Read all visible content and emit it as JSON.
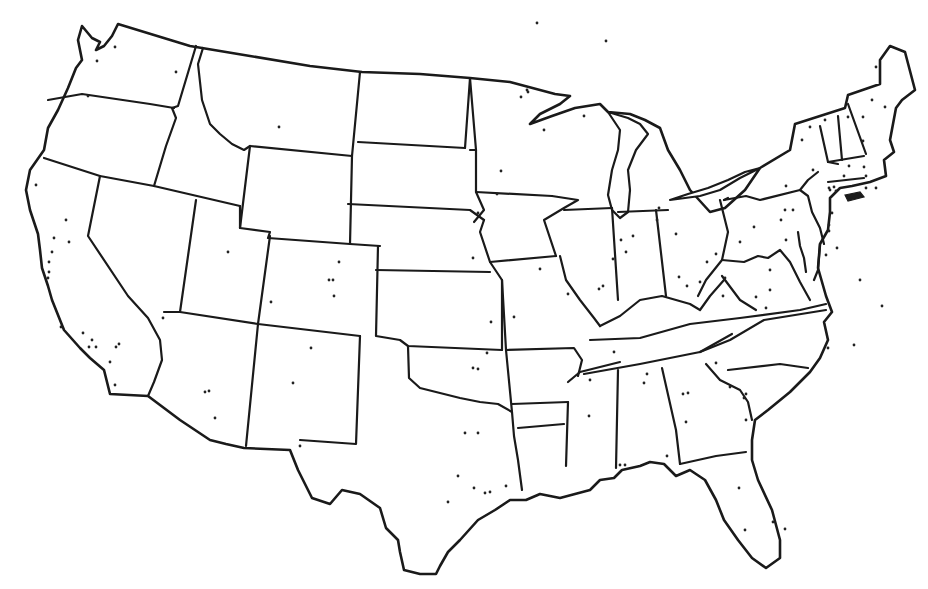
{
  "map": {
    "type": "outline-map",
    "subject": "Contiguous United States with state boundaries",
    "style": {
      "background": "#ffffff",
      "stroke": "#1a1a1a",
      "dot_color": "#222222"
    },
    "outline": "M82,26 L92,38 L100,42 L96,50 L104,46 L112,36 L118,24 L190,46 L250,56 L310,66 L362,72 L420,74 L470,78 L510,82 L555,94 L570,96 L560,104 L540,114 L530,124 L552,116 L575,108 L600,104 L608,112 L630,114 L645,120 L660,128 L668,150 L680,170 L690,190 L710,212 L725,208 L745,190 L760,168 L790,150 L795,124 L820,116 L845,108 L848,95 L880,84 L880,60 L890,46 L905,52 L915,90 L902,100 L896,108 L890,140 L894,152 L884,160 L886,176 L870,182 L852,186 L840,188 L830,198 L830,212 L828,230 L820,244 L818,268 L826,296 L832,312 L824,322 L828,340 L820,358 L810,372 L790,392 L768,410 L755,420 L752,440 L752,460 L758,480 L772,510 L780,540 L780,558 L766,568 L752,558 L738,540 L724,520 L716,500 L705,480 L690,470 L676,476 L664,464 L650,462 L640,466 L622,470 L614,478 L600,480 L590,490 L575,494 L560,498 L540,494 L526,500 L510,500 L495,510 L478,520 L460,540 L448,552 L440,566 L436,574 L420,574 L404,570 L400,552 L398,540 L386,528 L380,508 L360,494 L342,490 L330,504 L312,498 L298,470 L290,450 L244,448 L226,444 L210,440 L180,420 L148,396 L110,394 L104,370 L90,358 L80,348 L64,330 L52,300 L48,286 L42,268 L40,250 L38,234 L30,210 L26,190 L30,170 L44,150 L48,128 L58,110 L68,88 L76,68 L82,60 L78,40 Z",
    "lakes": [
      "M608,112 L620,130 L618,150 L612,170 L608,195 L612,210 L620,218 L628,212 L630,190 L628,170 L636,150 L648,134 L640,124 L628,118 Z",
      "M670,200 L700,196 L720,190 L740,178 L760,168 L745,172 L728,180 L708,188 L688,194 Z"
    ],
    "islands": [
      "M845,195 L860,192 L864,197 L848,201 Z"
    ],
    "state_borders": [
      "M48,100 L82,94 L150,104 L174,108",
      "M196,46 L178,106 L172,108 L176,118 L166,146 L154,186",
      "M203,48 L198,64 L202,100 L210,124 L220,134 L232,144 L244,150 L250,146",
      "M250,146 L352,156 L360,72",
      "M358,142 L465,148",
      "M465,148 L470,78",
      "M44,158 L100,176 L154,186 L240,206",
      "M100,176 L88,236 L128,296 L148,318 L160,340 L162,360 L154,382 L148,396",
      "M196,200 L180,312 L164,312",
      "M250,146 L240,228 L270,232 L268,238 L350,244 L380,246",
      "M350,244 L352,156",
      "M240,206 L240,228",
      "M348,204 L470,210 L484,220",
      "M270,236 L258,324 L246,446",
      "M180,312 L258,324 L360,336",
      "M378,246 L376,336 L388,338 L400,340 L408,346 L502,350",
      "M376,270 L490,272",
      "M360,336 L356,444 L300,440",
      "M408,346 L409,378 L420,388 L460,398 L480,402 L498,404 L512,412",
      "M470,78 L476,150 L476,192 L484,210 L474,222",
      "M476,192 L552,196",
      "M484,220 L480,232 L490,262 L502,280 L502,350",
      "M490,262 L556,256",
      "M556,256 L544,220 L564,208 L578,200 L552,196",
      "M476,150 L470,150",
      "M502,280 L506,350 L512,412 L514,436 L518,460 L522,490",
      "M506,350 L574,348 L582,360 L578,376",
      "M512,404 L568,402",
      "M518,428 L564,424",
      "M564,210 L612,208",
      "M560,256 L566,280 L580,300 L594,318 L600,326",
      "M612,208 L618,300",
      "M618,212 L668,210",
      "M656,210 L666,296",
      "M720,200 L728,232 L722,260 L706,280 L698,296",
      "M728,198 L724,200",
      "M600,326 L620,316 L640,300 L662,296 L690,304 L700,310 L710,296 L724,280",
      "M590,340 L640,338 L690,324 L740,318 L800,310 L826,304",
      "M584,374 L640,364 L700,352 L730,340 L764,320 L826,310",
      "M568,382 L580,372 L620,362",
      "M568,402 L566,466",
      "M618,370 L616,468",
      "M662,368 L676,430 L680,464",
      "M680,464 L716,456 L746,452",
      "M700,352 L732,334",
      "M706,364 L720,380 L740,390 L748,402 L752,420",
      "M728,370 L780,364 L808,368",
      "M724,200 L746,196 L760,200 L800,190 L808,196 L812,212 L820,228 L824,244",
      "M800,190 L808,180 L818,172",
      "M820,126 L828,162 L838,164",
      "M838,116 L842,160",
      "M848,104 L866,154",
      "M828,162 L864,156",
      "M828,182 L864,178",
      "M722,260 L744,262 L758,256 L768,258 L780,250 L790,262 L800,282 L810,300",
      "M722,276 L740,300 L756,310",
      "M798,232 L800,246 L804,258 L806,272",
      "M820,244 L818,270 L814,280"
    ],
    "city_dots": [
      [
        115,
        47
      ],
      [
        97,
        61
      ],
      [
        176,
        72
      ],
      [
        88,
        96
      ],
      [
        279,
        127
      ],
      [
        36,
        185
      ],
      [
        66,
        220
      ],
      [
        54,
        238
      ],
      [
        69,
        242
      ],
      [
        52,
        252
      ],
      [
        49,
        262
      ],
      [
        49,
        272
      ],
      [
        48,
        278
      ],
      [
        228,
        252
      ],
      [
        339,
        262
      ],
      [
        329,
        280
      ],
      [
        333,
        280
      ],
      [
        334,
        296
      ],
      [
        271,
        302
      ],
      [
        61,
        327
      ],
      [
        83,
        333
      ],
      [
        92,
        340
      ],
      [
        89,
        347
      ],
      [
        96,
        347
      ],
      [
        116,
        347
      ],
      [
        119,
        344
      ],
      [
        110,
        362
      ],
      [
        115,
        385
      ],
      [
        163,
        318
      ],
      [
        205,
        392
      ],
      [
        209,
        391
      ],
      [
        215,
        418
      ],
      [
        311,
        348
      ],
      [
        293,
        383
      ],
      [
        300,
        446
      ],
      [
        487,
        353
      ],
      [
        473,
        368
      ],
      [
        478,
        369
      ],
      [
        465,
        433
      ],
      [
        478,
        433
      ],
      [
        458,
        476
      ],
      [
        474,
        488
      ],
      [
        448,
        502
      ],
      [
        485,
        493
      ],
      [
        490,
        492
      ],
      [
        506,
        486
      ],
      [
        537,
        23
      ],
      [
        606,
        41
      ],
      [
        584,
        116
      ],
      [
        528,
        92
      ],
      [
        527,
        90
      ],
      [
        521,
        97
      ],
      [
        544,
        130
      ],
      [
        501,
        171
      ],
      [
        497,
        194
      ],
      [
        478,
        213
      ],
      [
        473,
        258
      ],
      [
        540,
        269
      ],
      [
        514,
        317
      ],
      [
        491,
        322
      ],
      [
        568,
        294
      ],
      [
        599,
        289
      ],
      [
        603,
        286
      ],
      [
        613,
        259
      ],
      [
        626,
        252
      ],
      [
        621,
        240
      ],
      [
        633,
        236
      ],
      [
        657,
        220
      ],
      [
        659,
        208
      ],
      [
        676,
        234
      ],
      [
        707,
        262
      ],
      [
        716,
        254
      ],
      [
        679,
        277
      ],
      [
        687,
        286
      ],
      [
        700,
        282
      ],
      [
        723,
        296
      ],
      [
        725,
        278
      ],
      [
        740,
        242
      ],
      [
        830,
        190
      ],
      [
        829,
        188
      ],
      [
        834,
        187
      ],
      [
        836,
        191
      ],
      [
        754,
        227
      ],
      [
        781,
        220
      ],
      [
        785,
        210
      ],
      [
        786,
        186
      ],
      [
        793,
        210
      ],
      [
        813,
        170
      ],
      [
        802,
        140
      ],
      [
        810,
        127
      ],
      [
        825,
        120
      ],
      [
        848,
        117
      ],
      [
        876,
        67
      ],
      [
        872,
        100
      ],
      [
        863,
        117
      ],
      [
        885,
        107
      ],
      [
        863,
        141
      ],
      [
        849,
        166
      ],
      [
        864,
        167
      ],
      [
        866,
        176
      ],
      [
        866,
        188
      ],
      [
        876,
        188
      ],
      [
        844,
        176
      ],
      [
        832,
        213
      ],
      [
        829,
        225
      ],
      [
        837,
        248
      ],
      [
        826,
        255
      ],
      [
        829,
        231
      ],
      [
        770,
        290
      ],
      [
        756,
        297
      ],
      [
        766,
        308
      ],
      [
        786,
        240
      ],
      [
        770,
        270
      ],
      [
        860,
        280
      ],
      [
        882,
        306
      ],
      [
        854,
        345
      ],
      [
        828,
        348
      ],
      [
        746,
        420
      ],
      [
        744,
        398
      ],
      [
        746,
        394
      ],
      [
        716,
        363
      ],
      [
        730,
        387
      ],
      [
        614,
        352
      ],
      [
        667,
        456
      ],
      [
        589,
        416
      ],
      [
        590,
        380
      ],
      [
        647,
        374
      ],
      [
        644,
        383
      ],
      [
        683,
        394
      ],
      [
        688,
        393
      ],
      [
        686,
        422
      ],
      [
        739,
        488
      ],
      [
        773,
        522
      ],
      [
        745,
        530
      ],
      [
        785,
        529
      ],
      [
        620,
        465
      ],
      [
        625,
        465
      ]
    ]
  }
}
